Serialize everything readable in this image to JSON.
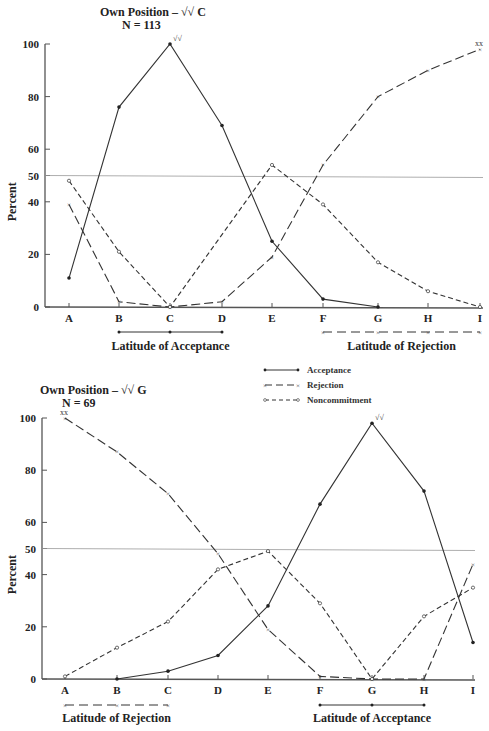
{
  "header_fragment": "(Section 2)",
  "legend": {
    "acceptance": "Acceptance",
    "rejection": "Rejection",
    "noncommitment": "Noncommitment"
  },
  "chart_data": [
    {
      "type": "line",
      "title": "Own Position – √√ C",
      "subtitle": "N = 113",
      "ylabel": "Percent",
      "xlabel": "",
      "categories": [
        "A",
        "B",
        "C",
        "D",
        "E",
        "F",
        "G",
        "H",
        "I"
      ],
      "yticks": [
        0,
        20,
        40,
        50,
        60,
        80,
        100
      ],
      "ylim": [
        0,
        100
      ],
      "reference_line": 50,
      "series": [
        {
          "name": "Acceptance",
          "style": "solid",
          "marker": "dot",
          "values": [
            11,
            76,
            100,
            69,
            25,
            3,
            0,
            null,
            null
          ]
        },
        {
          "name": "Rejection",
          "style": "long-dash",
          "marker": "x",
          "values": [
            39,
            2,
            0,
            2,
            19,
            54,
            80,
            90,
            98
          ]
        },
        {
          "name": "Noncommitment",
          "style": "short-dash",
          "marker": "o",
          "values": [
            48,
            21,
            0,
            null,
            54,
            39,
            17,
            6,
            0
          ]
        }
      ],
      "annotations": [
        {
          "at": "C",
          "series": "Acceptance",
          "text": "√√"
        },
        {
          "at": "I",
          "series": "Rejection",
          "text": "xx"
        }
      ],
      "latitude_of_acceptance": {
        "label": "Latitude of Acceptance",
        "span": [
          "B",
          "D"
        ]
      },
      "latitude_of_rejection": {
        "label": "Latitude of Rejection",
        "span": [
          "F",
          "I"
        ]
      }
    },
    {
      "type": "line",
      "title": "Own Position – √√ G",
      "subtitle": "N = 69",
      "ylabel": "Percent",
      "xlabel": "",
      "categories": [
        "A",
        "B",
        "C",
        "D",
        "E",
        "F",
        "G",
        "H",
        "I"
      ],
      "yticks": [
        0,
        20,
        40,
        50,
        60,
        80,
        100
      ],
      "ylim": [
        0,
        100
      ],
      "reference_line": 50,
      "series": [
        {
          "name": "Acceptance",
          "style": "solid",
          "marker": "dot",
          "values": [
            null,
            0,
            3,
            9,
            28,
            67,
            98,
            72,
            14
          ]
        },
        {
          "name": "Rejection",
          "style": "long-dash",
          "marker": "x",
          "values": [
            100,
            87,
            71,
            48,
            19,
            1,
            0,
            0,
            44
          ]
        },
        {
          "name": "Noncommitment",
          "style": "short-dash",
          "marker": "o",
          "values": [
            1,
            12,
            22,
            42,
            49,
            29,
            0,
            24,
            35
          ]
        }
      ],
      "annotations": [
        {
          "at": "G",
          "series": "Acceptance",
          "text": "√√"
        },
        {
          "at": "A",
          "series": "Rejection",
          "text": "xx"
        }
      ],
      "latitude_of_rejection": {
        "label": "Latitude of Rejection",
        "span": [
          "A",
          "C"
        ]
      },
      "latitude_of_acceptance": {
        "label": "Latitude of Acceptance",
        "span": [
          "F",
          "H"
        ]
      }
    }
  ]
}
